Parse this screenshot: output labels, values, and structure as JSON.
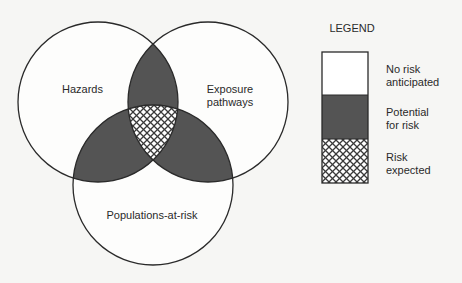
{
  "diagram": {
    "type": "venn",
    "sets": [
      {
        "id": "hazards",
        "label": "Hazards"
      },
      {
        "id": "exposure",
        "label_line1": "Exposure",
        "label_line2": "pathways"
      },
      {
        "id": "populations",
        "label": "Populations-at-risk"
      }
    ],
    "regions": {
      "single": "No risk anticipated",
      "pairwise": "Potential for risk",
      "triple": "Risk expected"
    },
    "colors": {
      "background": "#f6f6f4",
      "outline": "#2a2a2a",
      "potential_fill": "#545454",
      "hatch_line": "#3a3a3a",
      "hatch_bg": "#ffffff"
    }
  },
  "legend": {
    "title": "LEGEND",
    "items": [
      {
        "line1": "No risk",
        "line2": "anticipated",
        "swatch": "white"
      },
      {
        "line1": "Potential",
        "line2": "for risk",
        "swatch": "dark"
      },
      {
        "line1": "Risk",
        "line2": "expected",
        "swatch": "hatched"
      }
    ]
  }
}
